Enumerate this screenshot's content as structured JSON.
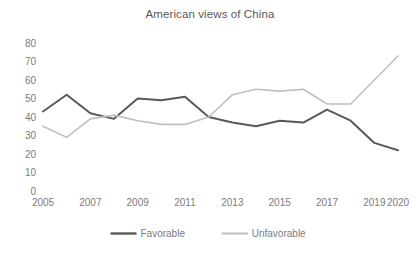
{
  "chart_data": {
    "type": "line",
    "title": "American views of China",
    "xlabel": "",
    "ylabel": "",
    "ylim": [
      0,
      80
    ],
    "ytick_step": 10,
    "yticks": [
      "0",
      "10",
      "20",
      "30",
      "40",
      "50",
      "60",
      "70",
      "80"
    ],
    "grid": false,
    "legend_position": "bottom-center",
    "x": [
      2005,
      2006,
      2007,
      2008,
      2009,
      2010,
      2011,
      2012,
      2013,
      2014,
      2015,
      2016,
      2017,
      2018,
      2019,
      2020
    ],
    "xtick_labels": [
      "2005",
      "2007",
      "2009",
      "2011",
      "2013",
      "2015",
      "2017",
      "2019",
      "2020"
    ],
    "xtick_values": [
      2005,
      2007,
      2009,
      2011,
      2013,
      2015,
      2017,
      2019,
      2020
    ],
    "series": [
      {
        "name": "Favorable",
        "color": "#595959",
        "width": 2,
        "values": [
          43,
          52,
          42,
          39,
          50,
          49,
          51,
          40,
          37,
          35,
          38,
          37,
          44,
          38,
          26,
          22
        ]
      },
      {
        "name": "Unfavorable",
        "color": "#bfbfbf",
        "width": 1.6,
        "values": [
          35,
          29,
          39,
          41,
          38,
          36,
          36,
          40,
          52,
          55,
          54,
          55,
          47,
          47,
          60,
          73
        ]
      }
    ]
  },
  "legend": {
    "items": [
      {
        "label": "Favorable",
        "color": "#595959"
      },
      {
        "label": "Unfavorable",
        "color": "#bfbfbf"
      }
    ]
  }
}
